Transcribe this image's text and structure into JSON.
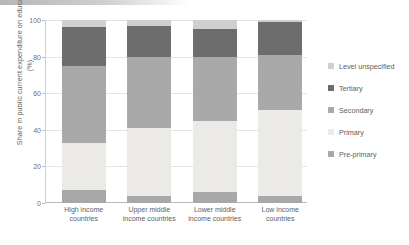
{
  "chart_data": {
    "type": "bar",
    "subtype": "stacked-bar-100",
    "title": "",
    "xlabel": "",
    "ylabel": "Share in public current expenditure on education (%)",
    "ylim": [
      0,
      100
    ],
    "yticks": [
      0,
      20,
      40,
      60,
      80,
      100
    ],
    "ytick_labels": [
      "0",
      "20",
      "40",
      "60",
      "80",
      "100"
    ],
    "grid": true,
    "legend_position": "right",
    "categories": [
      "High income countries",
      "Upper middle income countries",
      "Lower middle income countries",
      "Low income countries"
    ],
    "series": [
      {
        "name": "Pre-primary",
        "color": "#a8a8a8",
        "values": [
          7,
          4,
          6,
          4
        ]
      },
      {
        "name": "Primary",
        "color": "#eceae7",
        "values": [
          26,
          37,
          39,
          47
        ]
      },
      {
        "name": "Secondary",
        "color": "#a9a9a9",
        "values": [
          42,
          39,
          35,
          30
        ]
      },
      {
        "name": "Tertiary",
        "color": "#6d6d6d",
        "values": [
          21,
          17,
          15,
          18
        ]
      },
      {
        "name": "Level unspecified",
        "color": "#cfcfcf",
        "values": [
          4,
          3,
          5,
          1
        ]
      }
    ],
    "stack_order_bottom_to_top": [
      "Pre-primary",
      "Primary",
      "Secondary",
      "Tertiary",
      "Level unspecified"
    ]
  },
  "axis": {
    "y_title": "Share in public current expenditure on education (%)",
    "tick_labels": [
      "100",
      "80",
      "60",
      "40",
      "20",
      "0"
    ]
  },
  "x_categories": [
    {
      "line1": "High income",
      "line2": "countries"
    },
    {
      "line1": "Upper middle",
      "line2": "income countries"
    },
    {
      "line1": "Lower middle",
      "line2": "income countries"
    },
    {
      "line1": "Low income",
      "line2": "countries"
    }
  ],
  "legend": {
    "items": [
      {
        "label": "Level unspecified",
        "color": "#cfcfcf"
      },
      {
        "label": "Tertiary",
        "color": "#6d6d6d"
      },
      {
        "label": "Secondary",
        "color": "#a9a9a9"
      },
      {
        "label": "Primary",
        "color": "#eceae7"
      },
      {
        "label": "Pre-primary",
        "color": "#a8a8a8"
      }
    ]
  }
}
